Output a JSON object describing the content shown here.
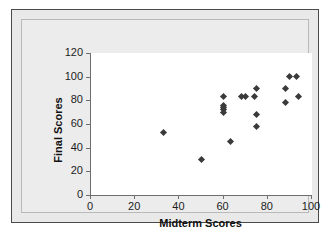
{
  "chart_data": {
    "type": "scatter",
    "title": "",
    "xlabel": "Midterm Scores",
    "ylabel": "Final Scores",
    "xlim": [
      0,
      100
    ],
    "ylim": [
      0,
      120
    ],
    "xticks": [
      0,
      20,
      40,
      60,
      80,
      100
    ],
    "yticks": [
      0,
      20,
      40,
      60,
      80,
      100,
      120
    ],
    "grid": false,
    "legend": false,
    "marker": "diamond",
    "marker_color": "#3a3a3a",
    "points": [
      {
        "x": 33,
        "y": 53
      },
      {
        "x": 50,
        "y": 30
      },
      {
        "x": 60,
        "y": 83
      },
      {
        "x": 60,
        "y": 76
      },
      {
        "x": 60,
        "y": 74
      },
      {
        "x": 60,
        "y": 72
      },
      {
        "x": 60,
        "y": 70
      },
      {
        "x": 63,
        "y": 45
      },
      {
        "x": 68,
        "y": 83
      },
      {
        "x": 70,
        "y": 83
      },
      {
        "x": 74,
        "y": 83
      },
      {
        "x": 75,
        "y": 90
      },
      {
        "x": 75,
        "y": 68
      },
      {
        "x": 75,
        "y": 58
      },
      {
        "x": 88,
        "y": 90
      },
      {
        "x": 88,
        "y": 78
      },
      {
        "x": 90,
        "y": 100
      },
      {
        "x": 93,
        "y": 100
      },
      {
        "x": 94,
        "y": 83
      }
    ]
  },
  "figure": {
    "background": "#ffffff",
    "panel_background": "#ececec",
    "plot_background": "#ffffff",
    "axis_color": "#6e6e6e",
    "frame_color": "#4a4a4a"
  }
}
